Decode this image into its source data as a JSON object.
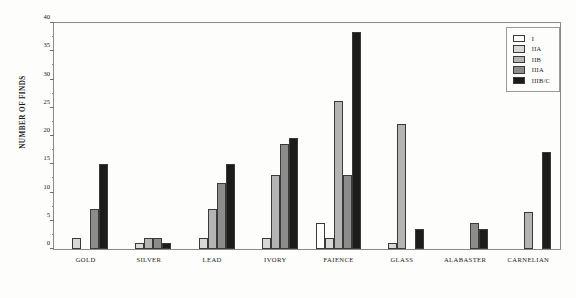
{
  "chart_data": {
    "type": "bar",
    "title": "",
    "xlabel": "",
    "ylabel": "NUMBER OF FINDS",
    "ylim": [
      0,
      40
    ],
    "ytick_step": 5,
    "yminor_step": 2.5,
    "grid": false,
    "legend_position": "top-right",
    "categories": [
      "GOLD",
      "SILVER",
      "LEAD",
      "IVORY",
      "FAIENCE",
      "GLASS",
      "ALABASTER",
      "CARNELIAN"
    ],
    "ytick_labels": [
      "0",
      "5",
      "10",
      "15",
      "20",
      "25",
      "30",
      "35",
      "40"
    ],
    "series": [
      {
        "name": "I",
        "color": "#ffffff",
        "values": [
          0,
          0,
          0,
          0,
          4.5,
          0,
          0,
          0
        ]
      },
      {
        "name": "IIA",
        "color": "#d8d8d8",
        "values": [
          2,
          1,
          2,
          2,
          2,
          1,
          0,
          0
        ]
      },
      {
        "name": "IIB",
        "color": "#b4b4b4",
        "values": [
          0,
          2,
          7,
          13,
          26,
          22,
          0,
          6.5
        ]
      },
      {
        "name": "IIIA",
        "color": "#8c8c8c",
        "values": [
          7,
          2,
          11.5,
          18.5,
          13,
          0,
          4.5,
          0
        ]
      },
      {
        "name": "IIIB/C",
        "color": "#1c1c1c",
        "values": [
          15,
          1,
          15,
          19.5,
          38,
          3.5,
          3.5,
          17
        ]
      }
    ]
  }
}
